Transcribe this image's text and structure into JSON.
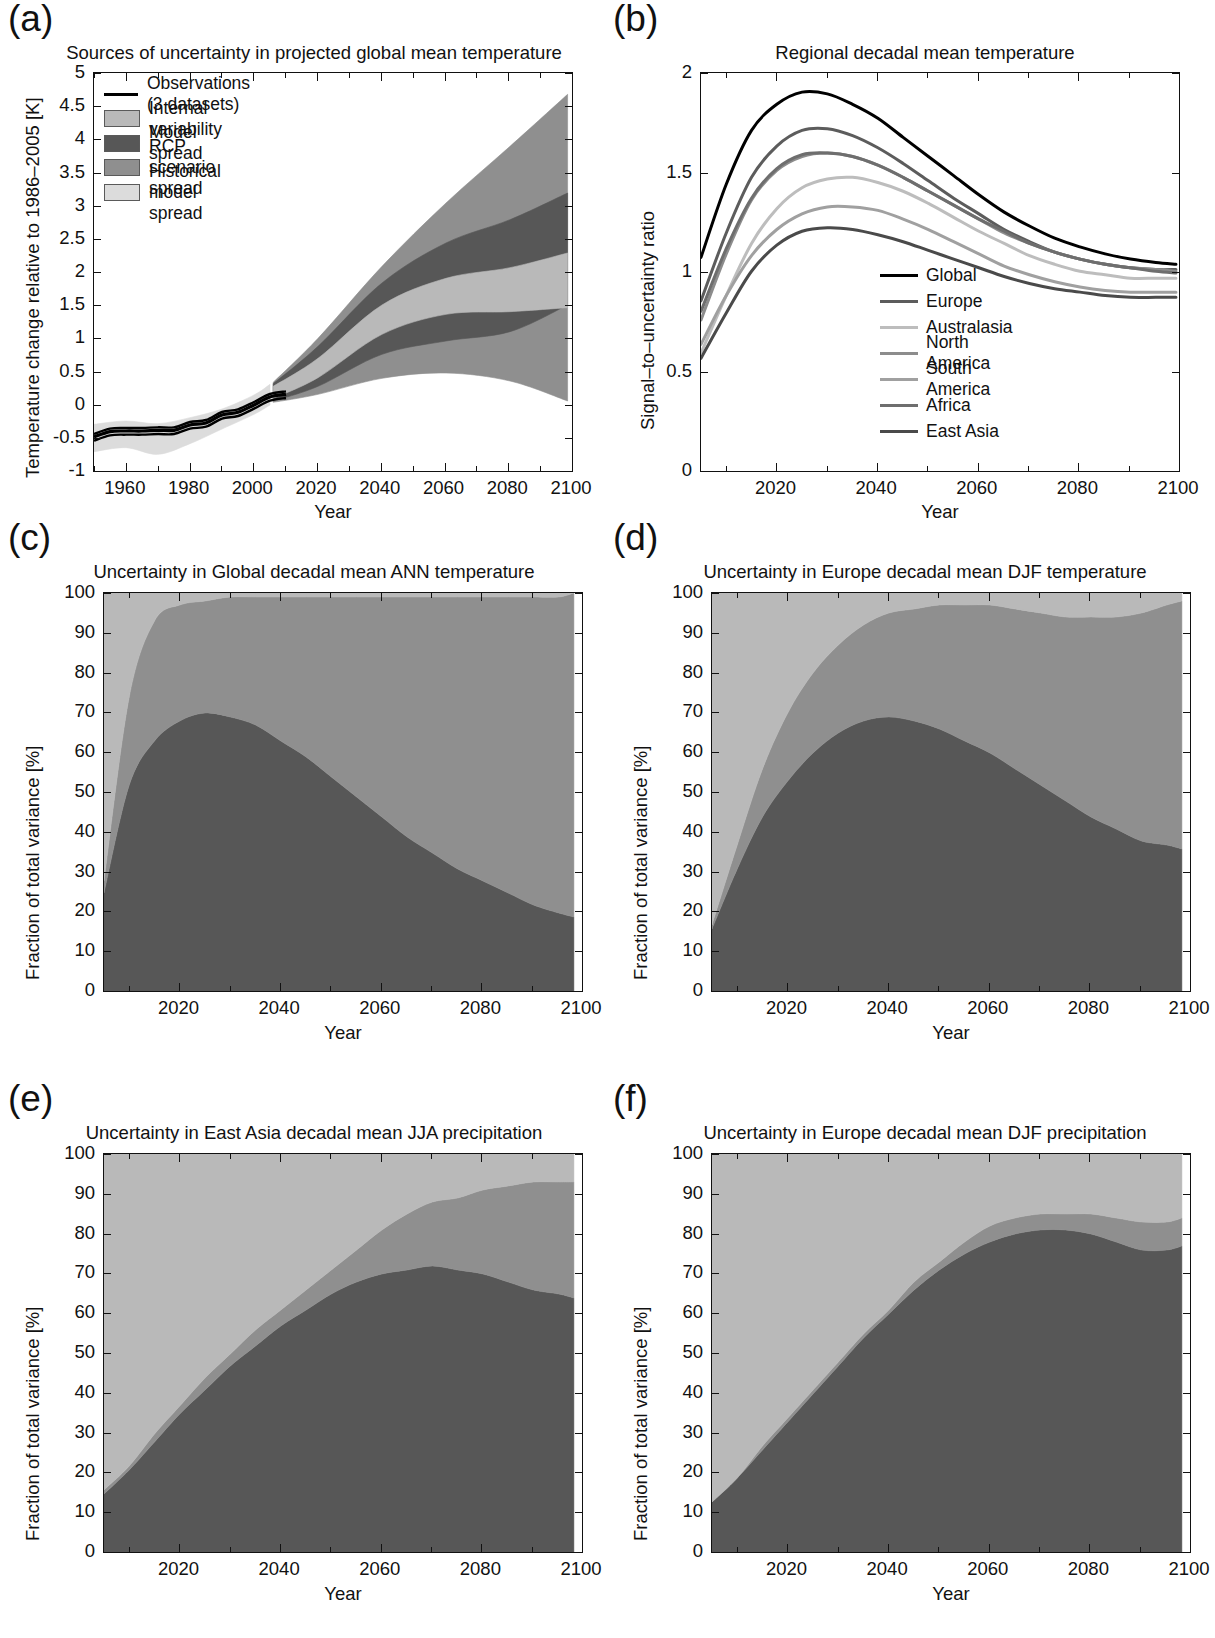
{
  "figure": {
    "panels": [
      "(a)",
      "(b)",
      "(c)",
      "(d)",
      "(e)",
      "(f)"
    ],
    "axis_label_x": "Year",
    "colors": {
      "internal_variability": "#b9b9b9",
      "model_spread": "#575757",
      "scenario_spread": "#8f8f8f",
      "historical_model_spread": "#dcdcdc",
      "observations": "#000000"
    }
  },
  "panel_a": {
    "tag": "(a)",
    "title": "Sources of uncertainty in projected global mean temperature",
    "ylabel": "Temperature change relative to 1986–2005 [K]",
    "xlabel": "Year",
    "yticks": [
      "-1",
      "-0.5",
      "0",
      "0.5",
      "1",
      "1.5",
      "2",
      "2.5",
      "3",
      "3.5",
      "4",
      "4.5",
      "5"
    ],
    "xticks": [
      "1960",
      "1980",
      "2000",
      "2020",
      "2040",
      "2060",
      "2080",
      "2100"
    ],
    "legend": [
      {
        "label": "Observations (3 datasets)",
        "type": "line",
        "color": "#000000"
      },
      {
        "label": "Internal variability",
        "type": "patch",
        "color": "#b9b9b9"
      },
      {
        "label": "Model spread",
        "type": "patch",
        "color": "#575757"
      },
      {
        "label": "RCP scenario spread",
        "type": "patch",
        "color": "#8f8f8f"
      },
      {
        "label": "Historical model spread",
        "type": "patch",
        "color": "#dcdcdc"
      }
    ],
    "chart_data": {
      "type": "area",
      "title": "Sources of uncertainty in projected global mean temperature",
      "xlabel": "Year",
      "ylabel": "Temperature change relative to 1986-2005 [K]",
      "xlim": [
        1950,
        2100
      ],
      "ylim": [
        -1,
        5
      ],
      "grid": false,
      "legend_position": "upper-left",
      "observations": {
        "name": "Observations (3 datasets)",
        "x": [
          1950,
          1955,
          1960,
          1965,
          1970,
          1975,
          1980,
          1985,
          1990,
          1995,
          2000,
          2005,
          2010
        ],
        "y": [
          -0.46,
          -0.38,
          -0.37,
          -0.37,
          -0.36,
          -0.36,
          -0.28,
          -0.25,
          -0.13,
          -0.09,
          0.02,
          0.14,
          0.18
        ]
      },
      "bands": [
        {
          "name": "Historical model spread",
          "color": "#dcdcdc",
          "x": [
            1950,
            1960,
            1970,
            1980,
            1990,
            2000,
            2005
          ],
          "lower": [
            -0.68,
            -0.62,
            -0.72,
            -0.56,
            -0.34,
            -0.12,
            0.02
          ],
          "upper": [
            -0.27,
            -0.22,
            -0.26,
            -0.17,
            -0.04,
            0.17,
            0.33
          ]
        },
        {
          "name": "Internal variability",
          "color": "#b9b9b9",
          "x": [
            2006,
            2020,
            2040,
            2060,
            2080,
            2098
          ],
          "lower": [
            0.12,
            0.43,
            1.08,
            1.38,
            1.42,
            1.48
          ],
          "upper": [
            0.3,
            0.72,
            1.52,
            1.92,
            2.08,
            2.3
          ]
        },
        {
          "name": "Model spread",
          "color": "#575757",
          "x": [
            2006,
            2020,
            2040,
            2060,
            2080,
            2098
          ],
          "lower": [
            0.08,
            0.3,
            0.78,
            0.98,
            1.12,
            1.52
          ],
          "upper": [
            0.34,
            0.9,
            1.85,
            2.45,
            2.8,
            3.2
          ]
        },
        {
          "name": "RCP scenario spread",
          "color": "#8f8f8f",
          "x": [
            2006,
            2020,
            2040,
            2060,
            2080,
            2098
          ],
          "lower": [
            0.06,
            0.18,
            0.42,
            0.5,
            0.38,
            0.08
          ],
          "upper": [
            0.36,
            1.02,
            2.1,
            3.05,
            3.9,
            4.68
          ]
        }
      ]
    }
  },
  "panel_b": {
    "tag": "(b)",
    "title": "Regional decadal mean temperature",
    "ylabel": "Signal–to–uncertainty ratio",
    "xlabel": "Year",
    "yticks": [
      "0",
      "0.5",
      "1",
      "1.5",
      "2"
    ],
    "xticks": [
      "2020",
      "2040",
      "2060",
      "2080",
      "2100"
    ],
    "legend": [
      {
        "label": "Global",
        "color": "#000000"
      },
      {
        "label": "Europe",
        "color": "#5c5c5c"
      },
      {
        "label": "Australasia",
        "color": "#bdbdbd"
      },
      {
        "label": "North America",
        "color": "#8c8c8c"
      },
      {
        "label": "South America",
        "color": "#a0a0a0"
      },
      {
        "label": "Africa",
        "color": "#6e6e6e"
      },
      {
        "label": "East Asia",
        "color": "#4a4a4a"
      }
    ],
    "chart_data": {
      "type": "line",
      "title": "Regional decadal mean temperature",
      "xlabel": "Year",
      "ylabel": "Signal-to-uncertainty ratio",
      "xlim": [
        2005,
        2100
      ],
      "ylim": [
        0,
        2.3
      ],
      "grid": false,
      "legend_position": "lower-center",
      "x": [
        2005,
        2010,
        2015,
        2020,
        2025,
        2030,
        2035,
        2040,
        2045,
        2050,
        2055,
        2060,
        2065,
        2070,
        2075,
        2080,
        2085,
        2090,
        2095,
        2099
      ],
      "series": [
        {
          "name": "Global",
          "color": "#000000",
          "values": [
            1.24,
            1.66,
            1.97,
            2.12,
            2.19,
            2.18,
            2.12,
            2.04,
            1.93,
            1.82,
            1.71,
            1.6,
            1.5,
            1.42,
            1.35,
            1.3,
            1.26,
            1.23,
            1.21,
            1.2
          ]
        },
        {
          "name": "Europe",
          "color": "#5c5c5c",
          "values": [
            0.99,
            1.38,
            1.7,
            1.88,
            1.97,
            1.98,
            1.94,
            1.87,
            1.78,
            1.68,
            1.58,
            1.49,
            1.4,
            1.33,
            1.27,
            1.23,
            1.2,
            1.18,
            1.17,
            1.17
          ]
        },
        {
          "name": "Australasia",
          "color": "#bdbdbd",
          "values": [
            0.69,
            1.02,
            1.32,
            1.52,
            1.64,
            1.69,
            1.7,
            1.67,
            1.62,
            1.55,
            1.47,
            1.39,
            1.32,
            1.25,
            1.2,
            1.16,
            1.14,
            1.12,
            1.12,
            1.12
          ]
        },
        {
          "name": "North America",
          "color": "#8c8c8c",
          "values": [
            0.88,
            1.26,
            1.57,
            1.74,
            1.82,
            1.84,
            1.82,
            1.77,
            1.7,
            1.62,
            1.54,
            1.46,
            1.38,
            1.32,
            1.27,
            1.23,
            1.2,
            1.18,
            1.17,
            1.16
          ]
        },
        {
          "name": "South America",
          "color": "#a0a0a0",
          "values": [
            0.74,
            1.02,
            1.25,
            1.4,
            1.49,
            1.53,
            1.53,
            1.51,
            1.46,
            1.4,
            1.33,
            1.26,
            1.19,
            1.14,
            1.1,
            1.07,
            1.05,
            1.04,
            1.04,
            1.04
          ]
        },
        {
          "name": "Africa",
          "color": "#6e6e6e",
          "values": [
            0.93,
            1.29,
            1.58,
            1.75,
            1.83,
            1.84,
            1.82,
            1.77,
            1.7,
            1.62,
            1.54,
            1.46,
            1.39,
            1.32,
            1.27,
            1.23,
            1.2,
            1.18,
            1.16,
            1.15
          ]
        },
        {
          "name": "East Asia",
          "color": "#4a4a4a",
          "values": [
            0.66,
            0.92,
            1.16,
            1.31,
            1.39,
            1.41,
            1.4,
            1.37,
            1.33,
            1.28,
            1.23,
            1.18,
            1.13,
            1.09,
            1.06,
            1.04,
            1.02,
            1.01,
            1.01,
            1.01
          ]
        }
      ]
    }
  },
  "panel_c": {
    "tag": "(c)",
    "title": "Uncertainty in Global decadal mean ANN temperature",
    "ylabel": "Fraction of total variance  [%]",
    "xlabel": "Year",
    "yticks": [
      "0",
      "10",
      "20",
      "30",
      "40",
      "50",
      "60",
      "70",
      "80",
      "90",
      "100"
    ],
    "xticks": [
      "2020",
      "2040",
      "2060",
      "2080",
      "2100"
    ],
    "chart_data": {
      "type": "area",
      "title": "Uncertainty in Global decadal mean ANN temperature",
      "xlabel": "Year",
      "ylabel": "Fraction of total variance [%]",
      "xlim": [
        2005,
        2100
      ],
      "ylim": [
        0,
        100
      ],
      "grid": false,
      "stacked": true,
      "x": [
        2005,
        2010,
        2015,
        2020,
        2025,
        2030,
        2035,
        2040,
        2045,
        2050,
        2055,
        2060,
        2065,
        2070,
        2075,
        2080,
        2085,
        2090,
        2095,
        2098
      ],
      "series": [
        {
          "name": "Model spread",
          "color": "#575757",
          "values": [
            25,
            52,
            63,
            68,
            70,
            69,
            67,
            63,
            59,
            54,
            49,
            44,
            39,
            35,
            31,
            28,
            25,
            22,
            20,
            19
          ]
        },
        {
          "name": "RCP scenario spread",
          "color": "#8f8f8f",
          "values": [
            3,
            22,
            30,
            29,
            28,
            30,
            32,
            36,
            40,
            45,
            50,
            55,
            60,
            64,
            68,
            71,
            74,
            77,
            79,
            81
          ]
        },
        {
          "name": "Internal variability",
          "color": "#b9b9b9",
          "values": [
            72,
            26,
            7,
            3,
            2,
            1,
            1,
            1,
            1,
            1,
            1,
            1,
            1,
            1,
            1,
            1,
            1,
            1,
            1,
            0
          ]
        }
      ]
    }
  },
  "panel_d": {
    "tag": "(d)",
    "title": "Uncertainty in Europe decadal mean DJF temperature",
    "ylabel": "Fraction of total variance  [%]",
    "xlabel": "Year",
    "yticks": [
      "0",
      "10",
      "20",
      "30",
      "40",
      "50",
      "60",
      "70",
      "80",
      "90",
      "100"
    ],
    "xticks": [
      "2020",
      "2040",
      "2060",
      "2080",
      "2100"
    ],
    "chart_data": {
      "type": "area",
      "title": "Uncertainty in Europe decadal mean DJF temperature",
      "xlabel": "Year",
      "ylabel": "Fraction of total variance [%]",
      "xlim": [
        2005,
        2100
      ],
      "ylim": [
        0,
        100
      ],
      "grid": false,
      "stacked": true,
      "x": [
        2005,
        2010,
        2015,
        2020,
        2025,
        2030,
        2035,
        2040,
        2045,
        2050,
        2055,
        2060,
        2065,
        2070,
        2075,
        2080,
        2085,
        2090,
        2095,
        2098
      ],
      "series": [
        {
          "name": "Model spread",
          "color": "#575757",
          "values": [
            16,
            31,
            44,
            53,
            60,
            65,
            68,
            69,
            68,
            66,
            63,
            60,
            56,
            52,
            48,
            44,
            41,
            38,
            37,
            36
          ]
        },
        {
          "name": "RCP scenario spread",
          "color": "#8f8f8f",
          "values": [
            1,
            6,
            12,
            17,
            20,
            22,
            24,
            26,
            28,
            31,
            34,
            37,
            40,
            43,
            46,
            50,
            53,
            57,
            60,
            62
          ]
        },
        {
          "name": "Internal variability",
          "color": "#b9b9b9",
          "values": [
            83,
            63,
            44,
            30,
            20,
            13,
            8,
            5,
            4,
            3,
            3,
            3,
            4,
            5,
            6,
            6,
            6,
            5,
            3,
            2
          ]
        }
      ]
    }
  },
  "panel_e": {
    "tag": "(e)",
    "title": "Uncertainty in East Asia decadal mean JJA precipitation",
    "ylabel": "Fraction of total variance  [%]",
    "xlabel": "Year",
    "yticks": [
      "0",
      "10",
      "20",
      "30",
      "40",
      "50",
      "60",
      "70",
      "80",
      "90",
      "100"
    ],
    "xticks": [
      "2020",
      "2040",
      "2060",
      "2080",
      "2100"
    ],
    "chart_data": {
      "type": "area",
      "title": "Uncertainty in East Asia decadal mean JJA precipitation",
      "xlabel": "Year",
      "ylabel": "Fraction of total variance [%]",
      "xlim": [
        2005,
        2100
      ],
      "ylim": [
        0,
        100
      ],
      "grid": false,
      "stacked": true,
      "x": [
        2005,
        2010,
        2015,
        2020,
        2025,
        2030,
        2035,
        2040,
        2045,
        2050,
        2055,
        2060,
        2065,
        2070,
        2075,
        2080,
        2085,
        2090,
        2095,
        2098
      ],
      "series": [
        {
          "name": "Model spread",
          "color": "#575757",
          "values": [
            15,
            21,
            28,
            35,
            41,
            47,
            52,
            57,
            61,
            65,
            68,
            70,
            71,
            72,
            71,
            70,
            68,
            66,
            65,
            64
          ]
        },
        {
          "name": "RCP scenario spread",
          "color": "#8f8f8f",
          "values": [
            1,
            1,
            2,
            2,
            3,
            3,
            4,
            4,
            5,
            6,
            8,
            11,
            14,
            16,
            18,
            21,
            24,
            27,
            28,
            29
          ]
        },
        {
          "name": "Internal variability",
          "color": "#b9b9b9",
          "values": [
            84,
            78,
            70,
            63,
            56,
            50,
            44,
            39,
            34,
            29,
            24,
            19,
            15,
            12,
            11,
            9,
            8,
            7,
            7,
            7
          ]
        }
      ]
    }
  },
  "panel_f": {
    "tag": "(f)",
    "title": "Uncertainty in Europe decadal mean DJF precipitation",
    "ylabel": "Fraction of total variance  [%]",
    "xlabel": "Year",
    "yticks": [
      "0",
      "10",
      "20",
      "30",
      "40",
      "50",
      "60",
      "70",
      "80",
      "90",
      "100"
    ],
    "xticks": [
      "2020",
      "2040",
      "2060",
      "2080",
      "2100"
    ],
    "chart_data": {
      "type": "area",
      "title": "Uncertainty in Europe decadal mean DJF precipitation",
      "xlabel": "Year",
      "ylabel": "Fraction of total variance [%]",
      "xlim": [
        2005,
        2100
      ],
      "ylim": [
        0,
        100
      ],
      "grid": false,
      "stacked": true,
      "x": [
        2005,
        2010,
        2015,
        2020,
        2025,
        2030,
        2035,
        2040,
        2045,
        2050,
        2055,
        2060,
        2065,
        2070,
        2075,
        2080,
        2085,
        2090,
        2095,
        2098
      ],
      "series": [
        {
          "name": "Model spread",
          "color": "#575757",
          "values": [
            13,
            19,
            26,
            33,
            40,
            47,
            54,
            60,
            66,
            71,
            75,
            78,
            80,
            81,
            81,
            80,
            78,
            76,
            76,
            77
          ]
        },
        {
          "name": "RCP scenario spread",
          "color": "#8f8f8f",
          "values": [
            0,
            0,
            1,
            1,
            1,
            1,
            1,
            1,
            2,
            2,
            3,
            4,
            4,
            4,
            4,
            5,
            6,
            7,
            7,
            7
          ]
        },
        {
          "name": "Internal variability",
          "color": "#b9b9b9",
          "values": [
            87,
            81,
            73,
            66,
            59,
            52,
            45,
            39,
            32,
            27,
            22,
            18,
            16,
            15,
            15,
            15,
            16,
            17,
            17,
            16
          ]
        }
      ]
    }
  }
}
